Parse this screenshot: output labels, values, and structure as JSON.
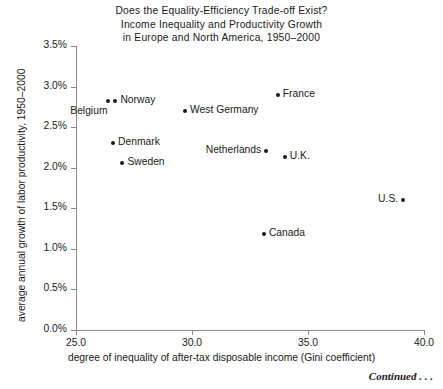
{
  "chart_data": {
    "type": "scatter",
    "title": "Does the Equality-Efficiency Trade-off Exist? Income Inequality and Productivity Growth in Europe and North America, 1950–2000",
    "title_lines": [
      "Does the Equality-Efficiency Trade-off Exist?",
      "Income Inequality and Productivity Growth",
      "in Europe and North America, 1950–2000"
    ],
    "xlabel": "degree of inequality of after-tax disposable income (Gini coefficient)",
    "ylabel": "average annual growth of labor productivity, 1950–2000",
    "xlim": [
      25.0,
      40.0
    ],
    "ylim": [
      0.0,
      3.5
    ],
    "xticks": [
      "25.0",
      "30.0",
      "35.0",
      "40.0"
    ],
    "xtick_values": [
      25.0,
      30.0,
      35.0,
      40.0
    ],
    "yticks": [
      "0.0%",
      "0.5%",
      "1.0%",
      "1.5%",
      "2.0%",
      "2.5%",
      "3.0%",
      "3.5%"
    ],
    "ytick_values": [
      0.0,
      0.5,
      1.0,
      1.5,
      2.0,
      2.5,
      3.0,
      3.5
    ],
    "grid": false,
    "legend": "none",
    "marker_color": "#1a1a1a",
    "points": [
      {
        "label": "Belgium",
        "x": 26.4,
        "y": 2.82,
        "label_pos": "below-left"
      },
      {
        "label": "Norway",
        "x": 26.7,
        "y": 2.82,
        "label_pos": "right"
      },
      {
        "label": "Denmark",
        "x": 26.6,
        "y": 2.3,
        "label_pos": "right"
      },
      {
        "label": "Sweden",
        "x": 27.0,
        "y": 2.06,
        "label_pos": "right"
      },
      {
        "label": "West Germany",
        "x": 29.7,
        "y": 2.7,
        "label_pos": "right"
      },
      {
        "label": "Netherlands",
        "x": 33.2,
        "y": 2.2,
        "label_pos": "left"
      },
      {
        "label": "France",
        "x": 33.7,
        "y": 2.9,
        "label_pos": "right"
      },
      {
        "label": "U.K.",
        "x": 34.0,
        "y": 2.13,
        "label_pos": "right"
      },
      {
        "label": "Canada",
        "x": 33.1,
        "y": 1.18,
        "label_pos": "right"
      },
      {
        "label": "U.S.",
        "x": 39.1,
        "y": 1.6,
        "label_pos": "left"
      }
    ]
  },
  "footer": {
    "continued": "Continued . . ."
  }
}
